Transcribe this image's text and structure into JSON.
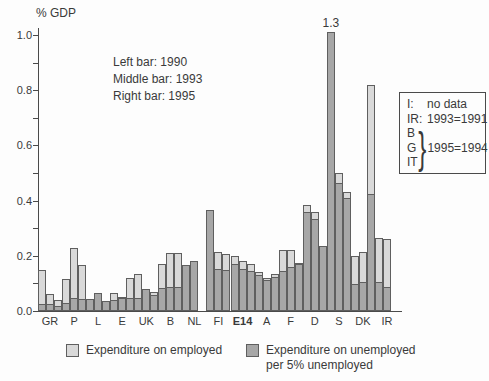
{
  "chart_data": {
    "type": "bar",
    "title": "",
    "ylabel": "% GDP",
    "xlabel": "",
    "ylim": [
      0,
      1.0
    ],
    "ytick_major": [
      0.0,
      0.2,
      0.4,
      0.6,
      0.8,
      1.0
    ],
    "ytick_minor": [
      0.1,
      0.3,
      0.5,
      0.7,
      0.9
    ],
    "grid": false,
    "legend_position": "bottom",
    "bar_meaning": {
      "left": "1990",
      "middle": "1993",
      "right": "1995"
    },
    "stack_series": [
      "Expenditure on unemployed per 5% unemployed",
      "Expenditure on employed"
    ],
    "groups": [
      {
        "label": "GR",
        "bold": false,
        "bars": [
          {
            "total": 0.15,
            "dark": 0.02
          },
          {
            "total": 0.06,
            "dark": 0.02
          },
          {
            "total": 0.04,
            "dark": 0.015
          }
        ]
      },
      {
        "label": "P",
        "bold": false,
        "bars": [
          {
            "total": 0.115,
            "dark": 0.025
          },
          {
            "total": 0.23,
            "dark": 0.045
          },
          {
            "total": 0.165,
            "dark": 0.04
          }
        ]
      },
      {
        "label": "L",
        "bold": false,
        "bars": [
          {
            "total": 0.045,
            "dark": 0.04
          },
          {
            "total": 0.065,
            "dark": 0.06
          },
          {
            "total": 0.035,
            "dark": 0.035
          }
        ]
      },
      {
        "label": "E",
        "bold": false,
        "bars": [
          {
            "total": 0.065,
            "dark": 0.035
          },
          {
            "total": 0.05,
            "dark": 0.045
          },
          {
            "total": 0.12,
            "dark": 0.045
          }
        ]
      },
      {
        "label": "UK",
        "bold": false,
        "bars": [
          {
            "total": 0.135,
            "dark": 0.045
          },
          {
            "total": 0.08,
            "dark": 0.08
          },
          {
            "total": 0.07,
            "dark": 0.055
          }
        ]
      },
      {
        "label": "B",
        "bold": false,
        "bars": [
          {
            "total": 0.17,
            "dark": 0.08
          },
          {
            "total": 0.21,
            "dark": 0.085
          },
          {
            "total": 0.21,
            "dark": 0.085
          }
        ]
      },
      {
        "label": "NL",
        "bold": false,
        "bars": [
          {
            "total": 0.165,
            "dark": 0.165
          },
          {
            "total": 0.18,
            "dark": 0.18
          },
          null
        ]
      },
      {
        "label": "FI",
        "bold": false,
        "bars": [
          {
            "total": 0.365,
            "dark": 0.365
          },
          {
            "total": 0.215,
            "dark": 0.15
          },
          {
            "total": 0.205,
            "dark": 0.145
          }
        ]
      },
      {
        "label": "E14",
        "bold": true,
        "bars": [
          {
            "total": 0.2,
            "dark": 0.165
          },
          {
            "total": 0.18,
            "dark": 0.15
          },
          {
            "total": 0.17,
            "dark": 0.14
          }
        ]
      },
      {
        "label": "A",
        "bold": false,
        "bars": [
          {
            "total": 0.14,
            "dark": 0.125
          },
          {
            "total": 0.12,
            "dark": 0.11
          },
          {
            "total": 0.135,
            "dark": 0.12
          }
        ]
      },
      {
        "label": "F",
        "bold": false,
        "bars": [
          {
            "total": 0.22,
            "dark": 0.14
          },
          {
            "total": 0.22,
            "dark": 0.155
          },
          {
            "total": 0.175,
            "dark": 0.165
          }
        ]
      },
      {
        "label": "D",
        "bold": false,
        "bars": [
          {
            "total": 0.385,
            "dark": 0.355
          },
          {
            "total": 0.36,
            "dark": 0.33
          },
          {
            "total": 0.235,
            "dark": 0.235
          }
        ]
      },
      {
        "label": "S",
        "bold": false,
        "bars": [
          {
            "total": 1.3,
            "dark": 1.3,
            "drawn_cap": 1.01,
            "data_label": "1.3"
          },
          {
            "total": 0.5,
            "dark": 0.46
          },
          {
            "total": 0.43,
            "dark": 0.405
          }
        ]
      },
      {
        "label": "DK",
        "bold": false,
        "bars": [
          {
            "total": 0.2,
            "dark": 0.095
          },
          {
            "total": 0.215,
            "dark": 0.1
          },
          {
            "total": 0.82,
            "dark": 0.42
          }
        ]
      },
      {
        "label": "IR",
        "bold": false,
        "bars": [
          {
            "total": 0.265,
            "dark": 0.1
          },
          {
            "total": 0.26,
            "dark": 0.085
          },
          null
        ]
      }
    ]
  },
  "colors": {
    "employed_fill": "#d9d9d9",
    "unemployed_fill": "#a7a7a7",
    "outline": "#5f5f5f",
    "axis": "#4a4a4a",
    "text": "#3a3a3a"
  },
  "axis": {
    "y_title": "% GDP",
    "y_tick_labels": [
      "0.0",
      "0.2",
      "0.4",
      "0.6",
      "0.8",
      "1.0"
    ]
  },
  "bar_key_note": {
    "line1": "Left bar: 1990",
    "line2": "Middle bar: 1993",
    "line3": "Right bar: 1995"
  },
  "note_box": {
    "row1": {
      "key": "I:",
      "value": "no data"
    },
    "row2": {
      "key": "IR:",
      "value": "1993=1991"
    },
    "group": {
      "items": [
        "B",
        "G",
        "IT"
      ],
      "value": "1995=1994"
    }
  },
  "legend": {
    "employed": {
      "label": "Expenditure on employed"
    },
    "unemployed": {
      "label_line1": "Expenditure on unemployed",
      "label_line2": "per 5% unemployed"
    }
  },
  "annotations": {
    "sweden_1990_label": "1.3"
  }
}
